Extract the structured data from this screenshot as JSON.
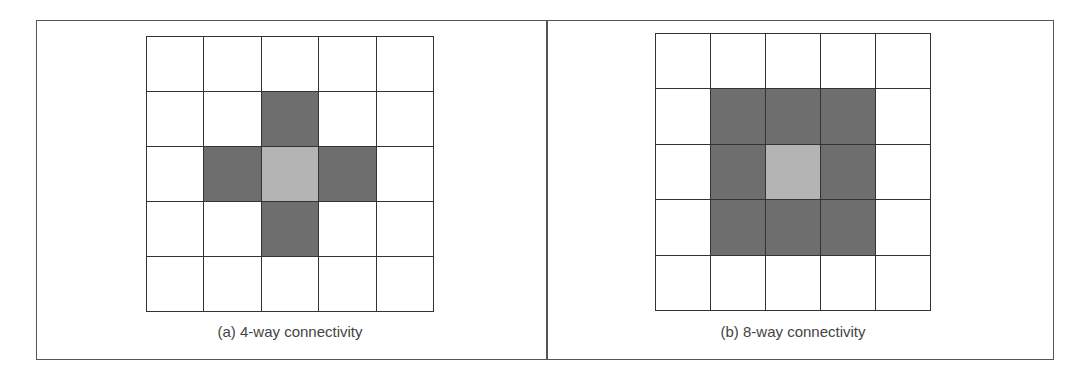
{
  "colors": {
    "neighbor": "#6e6e6e",
    "center": "#b4b4b4",
    "empty": "#ffffff",
    "lines": "#333333"
  },
  "panels": [
    {
      "caption": "(a) 4-way connectivity",
      "grid": [
        [
          0,
          0,
          0,
          0,
          0
        ],
        [
          0,
          0,
          1,
          0,
          0
        ],
        [
          0,
          1,
          2,
          1,
          0
        ],
        [
          0,
          0,
          1,
          0,
          0
        ],
        [
          0,
          0,
          0,
          0,
          0
        ]
      ]
    },
    {
      "caption": "(b) 8-way connectivity",
      "grid": [
        [
          0,
          0,
          0,
          0,
          0
        ],
        [
          0,
          1,
          1,
          1,
          0
        ],
        [
          0,
          1,
          2,
          1,
          0
        ],
        [
          0,
          1,
          1,
          1,
          0
        ],
        [
          0,
          0,
          0,
          0,
          0
        ]
      ]
    }
  ],
  "legend_key": {
    "0": "empty",
    "1": "neighbor",
    "2": "center"
  }
}
